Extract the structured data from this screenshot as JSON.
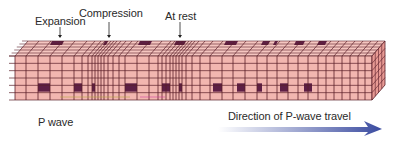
{
  "figure": {
    "title": "P wave",
    "labels": {
      "expansion": "Expansion",
      "compression": "Compression",
      "at_rest": "At rest",
      "wave_name": "P wave",
      "direction": "Direction of P-wave travel"
    },
    "colors": {
      "block_fill": "#f2b6b0",
      "block_top": "#f5c6c0",
      "block_side": "#e89a94",
      "grid_line": "#5a1f2a",
      "marker_cell": "#5e1f45",
      "arrow_start": "#ffffff",
      "arrow_end": "#3a4ba0"
    },
    "block": {
      "front": {
        "x0": 15,
        "x1": 372,
        "y0": 56,
        "y1": 100
      },
      "depth_dx": 13,
      "depth_dy": -15,
      "front_rows": 6,
      "top_rows": 5
    },
    "front_columns": [
      15,
      26,
      38,
      50,
      62,
      74,
      82,
      88,
      92,
      95,
      98,
      101,
      104,
      108,
      113,
      119,
      125,
      137,
      149,
      158,
      162,
      166,
      170,
      173,
      176,
      179,
      182,
      186,
      192,
      200,
      210,
      222,
      233,
      245,
      257,
      267,
      277,
      288,
      298,
      308,
      318,
      326,
      334,
      342,
      350,
      358,
      365,
      372
    ],
    "front_markers": [
      [
        38,
        50
      ],
      [
        74,
        82
      ],
      [
        92,
        95
      ],
      [
        125,
        137
      ],
      [
        162,
        170
      ],
      [
        179,
        182
      ],
      [
        213,
        222
      ],
      [
        237,
        245
      ],
      [
        257,
        262
      ],
      [
        280,
        288
      ],
      [
        304,
        312
      ]
    ],
    "top_markers": [
      [
        52,
        64
      ],
      [
        105,
        108
      ],
      [
        140,
        152
      ],
      [
        176,
        186
      ],
      [
        226,
        238
      ],
      [
        263,
        270
      ],
      [
        275,
        278
      ],
      [
        296,
        305
      ],
      [
        319,
        327
      ]
    ],
    "arrow": {
      "x0": 218,
      "x1": 382,
      "y": 129
    }
  }
}
